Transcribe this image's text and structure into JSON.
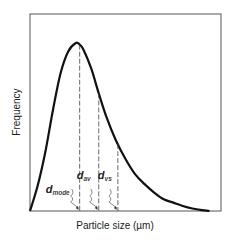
{
  "chart_data": {
    "type": "line",
    "title": "",
    "xlabel": "Particle size (µm)",
    "ylabel": "Frequency",
    "grid": false,
    "legend": "none",
    "xlim": [
      0,
      1
    ],
    "ylim": [
      0,
      1
    ],
    "series": [
      {
        "name": "Particle size distribution",
        "x": [
          0.0,
          0.04,
          0.08,
          0.12,
          0.16,
          0.2,
          0.24,
          0.26,
          0.28,
          0.32,
          0.36,
          0.4,
          0.45,
          0.5,
          0.55,
          0.6,
          0.65,
          0.7,
          0.75,
          0.8,
          0.85,
          0.9,
          0.94
        ],
        "y": [
          0.0,
          0.15,
          0.35,
          0.6,
          0.82,
          0.95,
          1.0,
          0.99,
          0.96,
          0.85,
          0.7,
          0.56,
          0.42,
          0.31,
          0.22,
          0.16,
          0.11,
          0.07,
          0.05,
          0.03,
          0.015,
          0.005,
          0.0
        ]
      }
    ],
    "markers": [
      {
        "label": "d",
        "subscript": "mode",
        "x": 0.26
      },
      {
        "label": "d",
        "subscript": "av",
        "x": 0.36
      },
      {
        "label": "d",
        "subscript": "vs",
        "x": 0.46
      }
    ]
  }
}
